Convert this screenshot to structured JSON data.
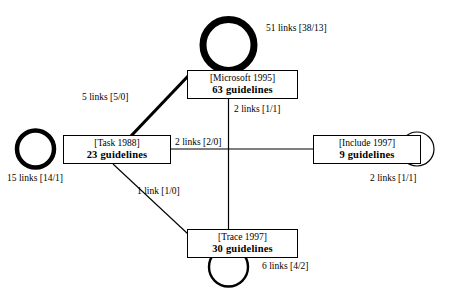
{
  "diagram": {
    "type": "node-link-graph",
    "nodes": [
      {
        "id": "microsoft",
        "title": "[Microsoft 1995]",
        "count": "63 guidelines",
        "self_loop_label": "51 links [38/13]"
      },
      {
        "id": "task",
        "title": "[Task 1988]",
        "count": "23 guidelines",
        "self_loop_label": "15 links [14/1]"
      },
      {
        "id": "include",
        "title": "[Include 1997]",
        "count": "9 guidelines",
        "self_loop_label": "2 links [1/1]"
      },
      {
        "id": "trace",
        "title": "[Trace 1997]",
        "count": "30 guidelines",
        "self_loop_label": "6 links [4/2]"
      }
    ],
    "edges": [
      {
        "id": "task-microsoft",
        "source": "task",
        "target": "microsoft",
        "label": "5 links [5/0]"
      },
      {
        "id": "microsoft-trace",
        "source": "microsoft",
        "target": "trace",
        "label": "2 links [1/1]"
      },
      {
        "id": "task-include",
        "source": "task",
        "target": "include",
        "label": "2 links [2/0]"
      },
      {
        "id": "task-trace",
        "source": "task",
        "target": "trace",
        "label": "1 link [1/0]"
      }
    ],
    "colors": {
      "stroke": "#000000",
      "background": "#ffffff"
    }
  }
}
